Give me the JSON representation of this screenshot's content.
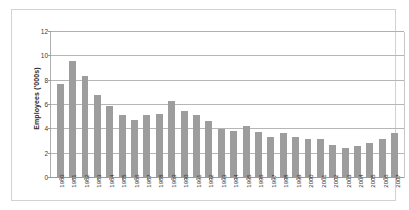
{
  "chart_data": {
    "type": "bar",
    "title": "",
    "subtitle": "",
    "xlabel": "",
    "ylabel": "Employees ('000s)",
    "categories": [
      "1980",
      "1981",
      "1982",
      "1983",
      "1984",
      "1985",
      "1986",
      "1987",
      "1988",
      "1989",
      "1990",
      "1991",
      "1992",
      "1993",
      "1994",
      "1995",
      "1996",
      "1997",
      "1998",
      "1999",
      "2000",
      "2001",
      "2002",
      "2003",
      "2004",
      "2005",
      "2006",
      "2007"
    ],
    "values": [
      7.7,
      9.6,
      8.4,
      6.8,
      5.9,
      5.2,
      4.8,
      5.2,
      5.3,
      6.3,
      5.5,
      5.2,
      4.7,
      4.0,
      3.9,
      4.3,
      3.8,
      3.4,
      3.7,
      3.4,
      3.2,
      3.2,
      2.7,
      2.5,
      2.6,
      2.9,
      3.2,
      3.7
    ],
    "series": [
      {
        "name": "Employees",
        "values": [
          7.7,
          9.6,
          8.4,
          6.8,
          5.9,
          5.2,
          4.8,
          5.2,
          5.3,
          6.3,
          5.5,
          5.2,
          4.7,
          4.0,
          3.9,
          4.3,
          3.8,
          3.4,
          3.7,
          3.4,
          3.2,
          3.2,
          2.7,
          2.5,
          2.6,
          2.9,
          3.2,
          3.7
        ]
      }
    ],
    "ylim": [
      0,
      12
    ],
    "yticks": [
      0,
      2,
      4,
      6,
      8,
      10,
      12
    ],
    "ytick_labels": [
      "0",
      "2",
      "4",
      "6",
      "8",
      "10",
      "12"
    ],
    "grid": true,
    "grid_axis": "y",
    "legend": false,
    "legend_position": "none",
    "bar_color": "#9d9d9d",
    "gridline_color": "#b6b6b6",
    "axis_color": "#aeaeae",
    "background_color": "#ffffff",
    "frame_color": "#d2d2d2",
    "annotations": []
  }
}
